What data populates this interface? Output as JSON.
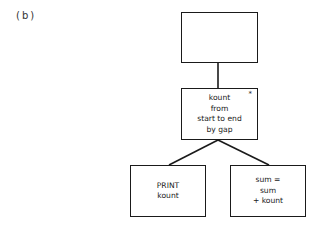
{
  "figure_label": "(b)",
  "nodes": {
    "root": {
      "lines": []
    },
    "loop": {
      "lines": [
        "kount",
        "from",
        "start to end",
        "by gap"
      ],
      "marker": "*"
    },
    "left": {
      "lines": [
        "PRINT",
        "kount"
      ]
    },
    "right": {
      "lines": [
        "sum =",
        "sum",
        "+ kount"
      ]
    }
  }
}
